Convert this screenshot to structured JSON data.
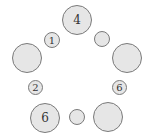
{
  "diagram": {
    "type": "ring-of-circles",
    "fill_color": "#e6e6e6",
    "stroke_color": "#7a7a7a",
    "nodes": [
      {
        "id": "top",
        "label": "4",
        "size": "big",
        "cx": 77,
        "cy": 20
      },
      {
        "id": "upper-left-small",
        "label": "1",
        "size": "small",
        "cx": 52,
        "cy": 40
      },
      {
        "id": "upper-right-small",
        "label": "",
        "size": "small",
        "cx": 102,
        "cy": 39
      },
      {
        "id": "left-big",
        "label": "",
        "size": "big",
        "cx": 27,
        "cy": 58
      },
      {
        "id": "right-big",
        "label": "",
        "size": "big",
        "cx": 127,
        "cy": 58
      },
      {
        "id": "left-small",
        "label": "2",
        "size": "tiny",
        "cx": 36,
        "cy": 88
      },
      {
        "id": "right-small",
        "label": "6",
        "size": "tiny",
        "cx": 120,
        "cy": 88
      },
      {
        "id": "bottom-left-big",
        "label": "6",
        "size": "big",
        "cx": 45,
        "cy": 118
      },
      {
        "id": "bottom-middle-small",
        "label": "",
        "size": "small",
        "cx": 77,
        "cy": 117
      },
      {
        "id": "bottom-right-big",
        "label": "",
        "size": "big",
        "cx": 108,
        "cy": 117
      }
    ]
  }
}
